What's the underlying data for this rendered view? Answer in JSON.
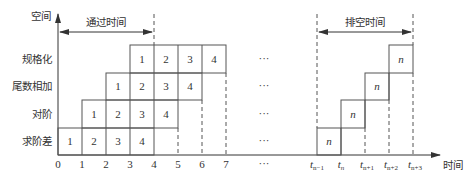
{
  "diagram": {
    "type": "pipeline-space-time",
    "axes": {
      "y_label": "空间",
      "x_label": "时间",
      "x_ticks_left": [
        "0",
        "1",
        "2",
        "3",
        "4",
        "5",
        "6",
        "7"
      ],
      "x_ellipsis": "···",
      "x_ticks_right": [
        {
          "base": "t",
          "sub": "n−1"
        },
        {
          "base": "t",
          "sub": "n"
        },
        {
          "base": "t",
          "sub": "n+1"
        },
        {
          "base": "t",
          "sub": "n+2"
        },
        {
          "base": "t",
          "sub": "n+3"
        }
      ]
    },
    "stages": [
      {
        "label": "规格化",
        "start": 3,
        "tasks": [
          "1",
          "2",
          "3",
          "4"
        ],
        "tail_task": "n",
        "tail_slot": 3
      },
      {
        "label": "尾数相加",
        "start": 2,
        "tasks": [
          "1",
          "2",
          "3",
          "4"
        ],
        "tail_task": "n",
        "tail_slot": 2
      },
      {
        "label": "对阶",
        "start": 1,
        "tasks": [
          "1",
          "2",
          "3",
          "4"
        ],
        "tail_task": "n",
        "tail_slot": 1
      },
      {
        "label": "求阶差",
        "start": 0,
        "tasks": [
          "1",
          "2",
          "3",
          "4"
        ],
        "tail_task": "n",
        "tail_slot": 0
      }
    ],
    "row_ellipsis": "···",
    "annotations": {
      "pass_time": "通过时间",
      "drain_time": "排空时间"
    },
    "colors": {
      "line": "#555555",
      "text": "#333333",
      "background": "#ffffff"
    }
  }
}
